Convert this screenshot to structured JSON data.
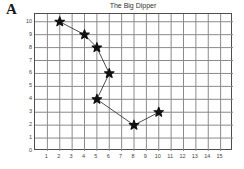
{
  "panel": {
    "label": "A"
  },
  "chart_data": {
    "type": "scatter",
    "title": "The Big Dipper",
    "xlabel": "",
    "ylabel": "",
    "xlim": [
      0,
      16
    ],
    "ylim": [
      0,
      10.6
    ],
    "grid": true,
    "legend": false,
    "legend_position": "none",
    "marker": "star",
    "marker_color": "#111111",
    "line_color": "#333333",
    "connected": true,
    "xticks": [
      1,
      2,
      3,
      4,
      5,
      6,
      7,
      8,
      9,
      10,
      11,
      12,
      13,
      14,
      15
    ],
    "xtick_labels": [
      "1",
      "2",
      "3",
      "4",
      "5",
      "6",
      "7",
      "8",
      "9",
      "10",
      "11",
      "12",
      "13",
      "14",
      "15"
    ],
    "yticks": [
      0,
      1,
      2,
      3,
      4,
      5,
      6,
      7,
      8,
      9,
      10
    ],
    "ytick_labels": [
      "0",
      "1",
      "2",
      "3",
      "4",
      "5",
      "6",
      "7",
      "8",
      "9",
      "10"
    ],
    "series": [
      {
        "name": "Big Dipper stars",
        "points": [
          {
            "x": 2,
            "y": 10
          },
          {
            "x": 4,
            "y": 9
          },
          {
            "x": 5,
            "y": 8
          },
          {
            "x": 6,
            "y": 6
          },
          {
            "x": 5,
            "y": 4
          },
          {
            "x": 8,
            "y": 2
          },
          {
            "x": 10,
            "y": 3
          }
        ]
      }
    ]
  },
  "colors": {
    "grid": "#8a8a8a",
    "axis": "#4d4d4d",
    "marker": "#111111",
    "line": "#3a3a3a",
    "text": "#444444",
    "background": "#ffffff"
  }
}
